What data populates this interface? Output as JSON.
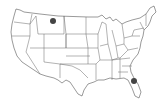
{
  "map": {
    "type": "us-states-outline",
    "background": "#ffffff",
    "stroke_color": "#555555",
    "markers": [
      {
        "name": "montana-marker",
        "region": "Montana",
        "cx": 53,
        "cy": 21,
        "r": 3,
        "color": "#444444"
      },
      {
        "name": "florida-marker",
        "region": "Florida",
        "cx": 134,
        "cy": 81,
        "r": 3,
        "color": "#444444"
      }
    ]
  }
}
